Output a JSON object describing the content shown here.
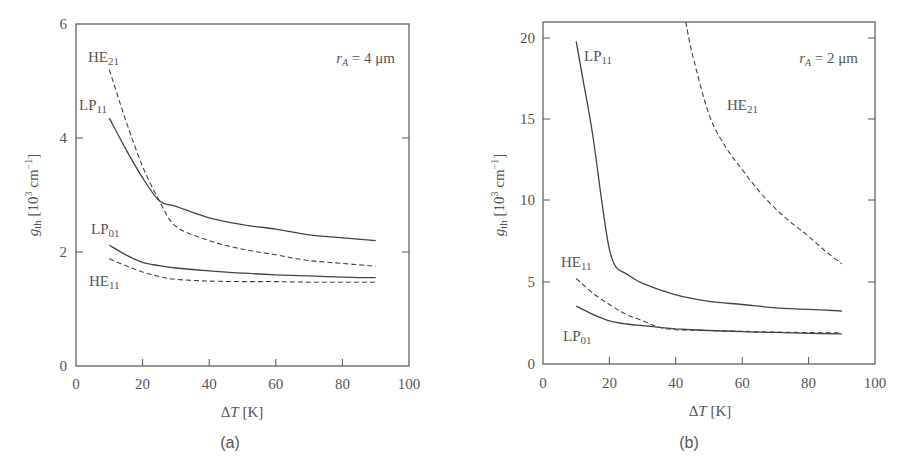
{
  "chart_data": [
    {
      "type": "line",
      "panel": "(a)",
      "annotation": "r_A = 4 μm",
      "xlabel": "ΔT [K]",
      "ylabel": "g_th [10^3 cm^-1]",
      "xlim": [
        0,
        100
      ],
      "ylim": [
        0,
        6
      ],
      "xticks": [
        0,
        20,
        40,
        60,
        80,
        100
      ],
      "yticks": [
        0,
        2,
        4,
        6
      ],
      "grid": false,
      "series": [
        {
          "name": "HE21",
          "style": "dashed",
          "x": [
            10,
            15,
            20,
            25,
            30,
            40,
            50,
            60,
            70,
            80,
            90
          ],
          "y": [
            5.2,
            4.3,
            3.5,
            2.9,
            2.45,
            2.2,
            2.05,
            1.95,
            1.85,
            1.8,
            1.75
          ]
        },
        {
          "name": "LP11",
          "style": "solid",
          "x": [
            10,
            15,
            20,
            25,
            30,
            40,
            50,
            60,
            70,
            80,
            90
          ],
          "y": [
            4.35,
            3.8,
            3.3,
            2.9,
            2.8,
            2.6,
            2.48,
            2.4,
            2.3,
            2.25,
            2.2
          ]
        },
        {
          "name": "LP01",
          "style": "solid",
          "x": [
            10,
            15,
            20,
            25,
            30,
            40,
            50,
            60,
            70,
            80,
            90
          ],
          "y": [
            2.12,
            1.95,
            1.82,
            1.76,
            1.72,
            1.67,
            1.63,
            1.6,
            1.58,
            1.56,
            1.55
          ]
        },
        {
          "name": "HE11",
          "style": "dashed",
          "x": [
            10,
            15,
            20,
            25,
            30,
            40,
            50,
            60,
            70,
            80,
            90
          ],
          "y": [
            1.88,
            1.76,
            1.65,
            1.57,
            1.52,
            1.49,
            1.48,
            1.48,
            1.47,
            1.47,
            1.47
          ]
        }
      ]
    },
    {
      "type": "line",
      "panel": "(b)",
      "annotation": "r_A = 2 μm",
      "xlabel": "ΔT [K]",
      "ylabel": "g_th [10^3 cm^-1]",
      "xlim": [
        0,
        100
      ],
      "ylim": [
        0,
        21
      ],
      "xticks": [
        0,
        20,
        40,
        60,
        80,
        100
      ],
      "yticks": [
        0,
        5,
        10,
        15,
        20
      ],
      "grid": false,
      "series": [
        {
          "name": "LP11",
          "style": "solid",
          "x": [
            10,
            12,
            15,
            18,
            20,
            22,
            25,
            30,
            40,
            50,
            60,
            70,
            80,
            90
          ],
          "y": [
            19.8,
            17.5,
            14.0,
            9.5,
            7.0,
            5.9,
            5.5,
            4.9,
            4.2,
            3.8,
            3.6,
            3.4,
            3.3,
            3.2
          ]
        },
        {
          "name": "HE21",
          "style": "dashed",
          "x": [
            43,
            45,
            50,
            55,
            60,
            65,
            70,
            75,
            80,
            85,
            90
          ],
          "y": [
            21.0,
            19.0,
            15.3,
            13.3,
            11.9,
            10.6,
            9.5,
            8.6,
            7.8,
            6.9,
            6.1
          ]
        },
        {
          "name": "HE11",
          "style": "dashed",
          "x": [
            10,
            15,
            20,
            25,
            30,
            35,
            40,
            50,
            60,
            70,
            80,
            90
          ],
          "y": [
            5.2,
            4.3,
            3.6,
            3.0,
            2.6,
            2.2,
            2.05,
            2.0,
            1.95,
            1.9,
            1.87,
            1.85
          ]
        },
        {
          "name": "LP01",
          "style": "solid",
          "x": [
            10,
            15,
            20,
            25,
            30,
            35,
            40,
            50,
            60,
            70,
            80,
            90
          ],
          "y": [
            3.5,
            3.0,
            2.6,
            2.4,
            2.3,
            2.2,
            2.1,
            2.0,
            1.93,
            1.88,
            1.83,
            1.8
          ]
        }
      ]
    }
  ],
  "panels": {
    "a": {
      "label": "(a)",
      "annotation_var": "r",
      "annotation_sub": "A",
      "annotation_val": " = 4 μm",
      "ylabel_main": "g",
      "ylabel_sub": "th",
      "ylabel_unit": " [10",
      "ylabel_exp": "3",
      "ylabel_unit2": " cm",
      "ylabel_exp2": "−1",
      "ylabel_close": "]",
      "xlabel_delta": "Δ",
      "xlabel_var": "T",
      "xlabel_unit": " [K]",
      "xticks": [
        "0",
        "20",
        "40",
        "60",
        "80",
        "100"
      ],
      "yticks": [
        "0",
        "2",
        "4",
        "6"
      ],
      "curve_labels": [
        {
          "main": "HE",
          "sub": "21"
        },
        {
          "main": "LP",
          "sub": "11"
        },
        {
          "main": "LP",
          "sub": "01"
        },
        {
          "main": "HE",
          "sub": "11"
        }
      ]
    },
    "b": {
      "label": "(b)",
      "annotation_var": "r",
      "annotation_sub": "A",
      "annotation_val": " = 2 μm",
      "ylabel_main": "g",
      "ylabel_sub": "th",
      "ylabel_unit": " [10",
      "ylabel_exp": "3",
      "ylabel_unit2": " cm",
      "ylabel_exp2": "−1",
      "ylabel_close": "]",
      "xlabel_delta": "Δ",
      "xlabel_var": "T",
      "xlabel_unit": " [K]",
      "xticks": [
        "0",
        "20",
        "40",
        "60",
        "80",
        "100"
      ],
      "yticks": [
        "0",
        "5",
        "10",
        "15",
        "20"
      ],
      "curve_labels": [
        {
          "main": "LP",
          "sub": "11"
        },
        {
          "main": "HE",
          "sub": "21"
        },
        {
          "main": "HE",
          "sub": "11"
        },
        {
          "main": "LP",
          "sub": "01"
        }
      ]
    }
  }
}
